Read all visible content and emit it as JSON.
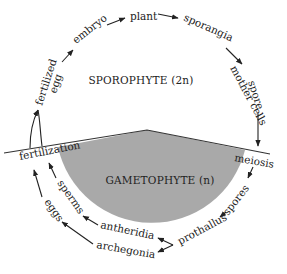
{
  "diagram": {
    "regions": {
      "sporophyte": {
        "label": "SPOROPHYTE (2n)",
        "fill": "#ffffff"
      },
      "gametophyte": {
        "label": "GAMETOPHYTE (n)",
        "fill": "#a9a9a9"
      }
    },
    "transitions": {
      "fertilization": "fertilization",
      "meiosis": "meiosis"
    },
    "sporophyte_stages": {
      "fertilized_egg_line1": "fertilized",
      "fertilized_egg_line2": "egg",
      "embryo": "embryo",
      "plant": "plant",
      "sporangia": "sporangia",
      "spore_mother_cells_line1": "spore",
      "spore_mother_cells_line2": "mother cells"
    },
    "gametophyte_stages": {
      "spores": "spores",
      "prothallus": "prothallus",
      "antheridia": "antheridia",
      "archegonia": "archegonia",
      "sperms": "sperms",
      "eggs": "eggs"
    },
    "colors": {
      "line": "#333333",
      "gray_region": "#a9a9a9",
      "text": "#222222"
    }
  }
}
